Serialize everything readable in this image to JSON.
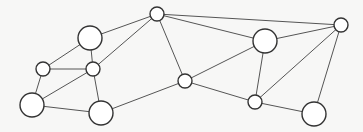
{
  "diagram": {
    "type": "network-graph",
    "colors": {
      "background": "#f7f7f6",
      "node_fill": "#ffffff",
      "node_stroke": "#333333",
      "edge": "#555555"
    },
    "nodes": [
      {
        "id": "A",
        "x": 157,
        "y": 14,
        "r": 7,
        "size": "small"
      },
      {
        "id": "B",
        "x": 90,
        "y": 38,
        "r": 12,
        "size": "large"
      },
      {
        "id": "C",
        "x": 43,
        "y": 69,
        "r": 7,
        "size": "small"
      },
      {
        "id": "D",
        "x": 93,
        "y": 69,
        "r": 7,
        "size": "small"
      },
      {
        "id": "E",
        "x": 32,
        "y": 105,
        "r": 12,
        "size": "large"
      },
      {
        "id": "F",
        "x": 101,
        "y": 113,
        "r": 12,
        "size": "large"
      },
      {
        "id": "G",
        "x": 185,
        "y": 81,
        "r": 7,
        "size": "small"
      },
      {
        "id": "H",
        "x": 265,
        "y": 41,
        "r": 12,
        "size": "large"
      },
      {
        "id": "I",
        "x": 341,
        "y": 25,
        "r": 7,
        "size": "small"
      },
      {
        "id": "J",
        "x": 255,
        "y": 102,
        "r": 7,
        "size": "small"
      },
      {
        "id": "K",
        "x": 314,
        "y": 114,
        "r": 12,
        "size": "large"
      }
    ],
    "edges": [
      [
        "A",
        "B"
      ],
      [
        "A",
        "D"
      ],
      [
        "A",
        "G"
      ],
      [
        "A",
        "H"
      ],
      [
        "A",
        "I"
      ],
      [
        "B",
        "C"
      ],
      [
        "B",
        "D"
      ],
      [
        "C",
        "D"
      ],
      [
        "C",
        "E"
      ],
      [
        "D",
        "E"
      ],
      [
        "D",
        "F"
      ],
      [
        "E",
        "F"
      ],
      [
        "F",
        "G"
      ],
      [
        "G",
        "H"
      ],
      [
        "G",
        "J"
      ],
      [
        "H",
        "I"
      ],
      [
        "H",
        "J"
      ],
      [
        "I",
        "J"
      ],
      [
        "I",
        "K"
      ],
      [
        "J",
        "K"
      ]
    ]
  }
}
